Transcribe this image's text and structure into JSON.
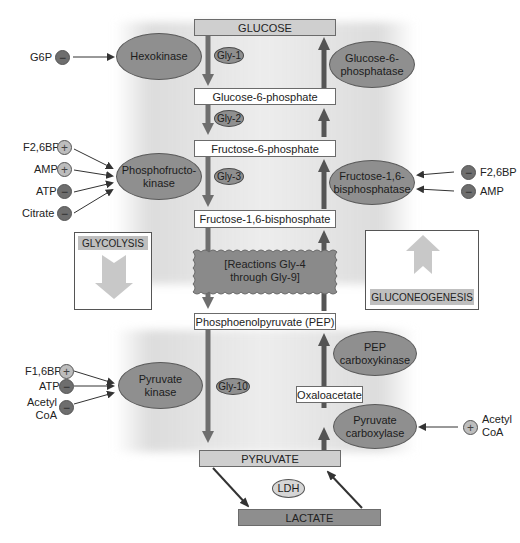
{
  "metabolites": {
    "glucose": "GLUCOSE",
    "g6p": "Glucose-6-phosphate",
    "f6p": "Fructose-6-phosphate",
    "f16bp": "Fructose-1,6-bisphosphate",
    "pep": "Phosphoenolpyruvate (PEP)",
    "oxaloacetate": "Oxaloacetate",
    "pyruvate": "PYRUVATE",
    "lactate": "LACTATE"
  },
  "enzymes": {
    "hexokinase": "Hexokinase",
    "g6pase_1": "Glucose-6-",
    "g6pase_2": "phosphatase",
    "pfk_1": "Phosphofructo-",
    "pfk_2": "kinase",
    "fbpase_1": "Fructose-1,6-",
    "fbpase_2": "bisphosphatase",
    "pepck_1": "PEP",
    "pepck_2": "carboxykinase",
    "pk_1": "Pyruvate",
    "pk_2": "kinase",
    "pc_1": "Pyruvate",
    "pc_2": "carboxylase",
    "ldh": "LDH"
  },
  "steps": {
    "gly1": "Gly-1",
    "gly2": "Gly-2",
    "gly3": "Gly-3",
    "gly10": "Gly-10",
    "reactions_1": "[Reactions Gly-4",
    "reactions_2": "through Gly-9]"
  },
  "panels": {
    "glycolysis": "GLYCOLYSIS",
    "gluconeogenesis": "GLUCONEOGENESIS"
  },
  "regulators": {
    "hexokinase": [
      {
        "name": "G6P",
        "sign": "−"
      }
    ],
    "pfk": [
      {
        "name": "F2,6BP",
        "sign": "+"
      },
      {
        "name": "AMP",
        "sign": "+"
      },
      {
        "name": "ATP",
        "sign": "−"
      },
      {
        "name": "Citrate",
        "sign": "−"
      }
    ],
    "fbpase": [
      {
        "name": "F2,6BP",
        "sign": "−"
      },
      {
        "name": "AMP",
        "sign": "−"
      }
    ],
    "pk": [
      {
        "name": "F1,6BP",
        "sign": "+"
      },
      {
        "name": "ATP",
        "sign": "−"
      },
      {
        "name": "Acetyl",
        "name2": "CoA",
        "sign": "−"
      }
    ],
    "pc": [
      {
        "name": "Acetyl",
        "name2": "CoA",
        "sign": "+"
      }
    ]
  },
  "colors": {
    "arrow": "#6e6e6e",
    "ellipse": "#8f8f8f",
    "panel_arrow": "#c8c8c8",
    "box_light": "#cfcfcf",
    "box_dark": "#8e8e8e"
  }
}
